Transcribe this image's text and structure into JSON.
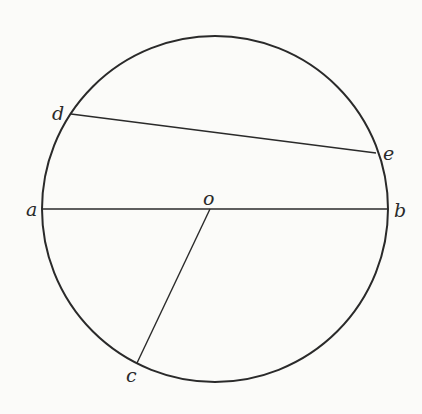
{
  "diagram": {
    "type": "geometry-circle",
    "stroke_color": "#2a2a2a",
    "background_color": "#fbfbf9",
    "circle": {
      "cx": 215,
      "cy": 209,
      "r": 173
    },
    "points": {
      "a": {
        "label": "a",
        "x": 42,
        "y": 209
      },
      "b": {
        "label": "b",
        "x": 388,
        "y": 209
      },
      "o": {
        "label": "o",
        "x": 210,
        "y": 209
      },
      "d": {
        "label": "d",
        "x": 71,
        "y": 114
      },
      "e": {
        "label": "e",
        "x": 376,
        "y": 153
      },
      "c": {
        "label": "c",
        "x": 137,
        "y": 363
      }
    },
    "segments": [
      {
        "name": "diameter-ab",
        "from": "a",
        "to": "b"
      },
      {
        "name": "chord-de",
        "from": "d",
        "to": "e"
      },
      {
        "name": "radius-oc",
        "from": "o",
        "to": "c"
      }
    ],
    "labels": {
      "a": "a",
      "b": "b",
      "o": "o",
      "d": "d",
      "e": "e",
      "c": "c"
    }
  }
}
